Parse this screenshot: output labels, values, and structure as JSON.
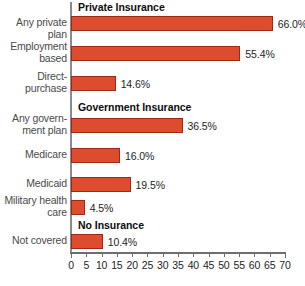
{
  "chart_data": {
    "type": "bar",
    "orientation": "horizontal",
    "title": "",
    "xlabel": "",
    "ylabel": "",
    "xlim": [
      0,
      70
    ],
    "xticks": [
      0,
      5,
      10,
      15,
      20,
      25,
      30,
      35,
      40,
      45,
      50,
      55,
      60,
      65,
      70
    ],
    "grid": false,
    "legend": "none",
    "bar_color": "#dd4c2f",
    "bar_border_color": "#9e2a15",
    "categories": [
      "Any private plan",
      "Employment based",
      "Direct-purchase",
      "Any government plan",
      "Medicare",
      "Medicaid",
      "Military health care",
      "Not covered"
    ],
    "values": [
      66.0,
      55.4,
      14.6,
      36.5,
      16.0,
      19.5,
      4.5,
      10.4
    ],
    "value_labels": [
      "66.0%",
      "55.4%",
      "14.6%",
      "36.5%",
      "16.0%",
      "19.5%",
      "4.5%",
      "10.4%"
    ],
    "groups": [
      {
        "label": "Private Insurance",
        "members": [
          0,
          1,
          2
        ]
      },
      {
        "label": "Government Insurance",
        "members": [
          3,
          4,
          5,
          6
        ]
      },
      {
        "label": "No Insurance",
        "members": [
          7
        ]
      }
    ]
  },
  "bars": [
    {
      "label": "Any private\nplan",
      "value": 66.0,
      "value_label": "66.0%",
      "y": 16,
      "label_y": 17
    },
    {
      "label": "Employment\nbased",
      "value": 55.4,
      "value_label": "55.4%",
      "y": 46,
      "label_y": 41
    },
    {
      "label": "Direct-\npurchase",
      "value": 14.6,
      "value_label": "14.6%",
      "y": 76,
      "label_y": 71
    },
    {
      "label": "Any govern-\nment plan",
      "value": 36.5,
      "value_label": "36.5%",
      "y": 118,
      "label_y": 113
    },
    {
      "label": "Medicare",
      "value": 16.0,
      "value_label": "16.0%",
      "y": 148,
      "label_y": 149
    },
    {
      "label": "Medicaid",
      "value": 19.5,
      "value_label": "19.5%",
      "y": 177,
      "label_y": 178
    },
    {
      "label": "Military health\ncare",
      "value": 4.5,
      "value_label": "4.5%",
      "y": 200,
      "label_y": 195
    },
    {
      "label": "Not covered",
      "value": 10.4,
      "value_label": "10.4%",
      "y": 234,
      "label_y": 235
    }
  ],
  "group_headers": [
    {
      "label": "Private Insurance",
      "y": 1
    },
    {
      "label": "Government Insurance",
      "y": 101
    },
    {
      "label": "No Insurance",
      "y": 219
    }
  ],
  "axis": {
    "ticks": [
      {
        "label": "0",
        "value": 0
      },
      {
        "label": "5",
        "value": 5
      },
      {
        "label": "10",
        "value": 10
      },
      {
        "label": "15",
        "value": 15
      },
      {
        "label": "20",
        "value": 20
      },
      {
        "label": "25",
        "value": 25
      },
      {
        "label": "30",
        "value": 30
      },
      {
        "label": "35",
        "value": 35
      },
      {
        "label": "40",
        "value": 40
      },
      {
        "label": "45",
        "value": 45
      },
      {
        "label": "50",
        "value": 50
      },
      {
        "label": "55",
        "value": 55
      },
      {
        "label": "60",
        "value": 60
      },
      {
        "label": "65",
        "value": 65
      },
      {
        "label": "70",
        "value": 70
      }
    ]
  }
}
